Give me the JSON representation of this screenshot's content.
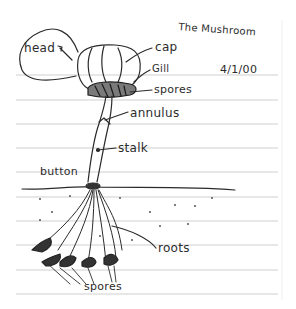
{
  "title": "The Mushroom",
  "date": "4/1/00",
  "header_fragment": "",
  "labels": {
    "head": "head",
    "cap": "cap",
    "gill": "Gill",
    "spores_top": "spores",
    "annulus": "annulus",
    "stalk": "stalk",
    "button": "button",
    "roots": "roots",
    "spores_bottom": "spores"
  },
  "colors": {
    "ink": "#2b2b2b",
    "rule": "#c8c8c8",
    "paper": "#ffffff"
  },
  "ruled_lines_y": [
    75,
    100,
    124,
    148,
    172,
    197,
    221,
    245,
    270,
    294
  ]
}
